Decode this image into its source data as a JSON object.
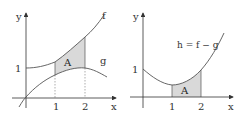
{
  "colors": {
    "axis": "#333333",
    "curve": "#555555",
    "shade": "#d9d9d9",
    "dashed": "#777777"
  },
  "left_panel": {
    "axis_labels": {
      "x": "x",
      "y": "y"
    },
    "ticks": {
      "x1": "1",
      "x2": "2",
      "y1": "1"
    },
    "curve_labels": {
      "f": "f",
      "g": "g"
    },
    "region_label": "A"
  },
  "right_panel": {
    "axis_labels": {
      "x": "x",
      "y": "y"
    },
    "ticks": {
      "x1": "1",
      "x2": "2",
      "y1": "1"
    },
    "curve_label": "h = f − g",
    "region_label": "A"
  }
}
